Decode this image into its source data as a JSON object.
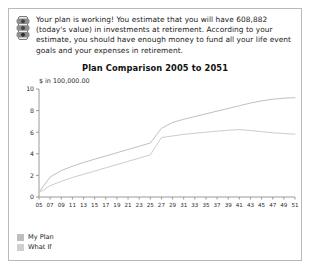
{
  "panel": {
    "status_icon": "traffic-light-icon",
    "message": "Your plan is working! You estimate that you will have 608,882 (today's value) in investments at retirement. According to your estimate, you should have enough money to fund all your life event goals and your expenses in retirement."
  },
  "legend": {
    "items": [
      {
        "label": "My Plan",
        "color": "#bdbdbd"
      },
      {
        "label": "What If",
        "color": "#cfcfcf"
      }
    ]
  },
  "chart_data": {
    "type": "line",
    "title": "Plan Comparison 2005 to 2051",
    "xlabel": "",
    "ylabel": "$ in 100,000.00",
    "unit_label": "$ in 100,000.00",
    "grid": false,
    "legend_position": "bottom-left",
    "xlim": [
      5,
      51
    ],
    "ylim": [
      0,
      10
    ],
    "yticks": [
      0,
      2,
      4,
      6,
      8,
      10
    ],
    "ytick_labels": [
      "0",
      "2",
      "4",
      "6",
      "8",
      "10"
    ],
    "x": [
      5,
      7,
      9,
      11,
      13,
      15,
      17,
      19,
      21,
      23,
      25,
      27,
      29,
      31,
      33,
      35,
      37,
      39,
      41,
      43,
      45,
      47,
      49,
      51
    ],
    "xtick_labels": [
      "05",
      "07",
      "09",
      "11",
      "13",
      "15",
      "17",
      "19",
      "21",
      "23",
      "25",
      "27",
      "29",
      "31",
      "33",
      "35",
      "37",
      "39",
      "41",
      "43",
      "45",
      "47",
      "49",
      "51"
    ],
    "series": [
      {
        "name": "My Plan",
        "color": "#c0c0c0",
        "values": [
          0.45,
          1.85,
          2.45,
          2.85,
          3.2,
          3.5,
          3.8,
          4.1,
          4.4,
          4.7,
          5.0,
          6.35,
          6.9,
          7.2,
          7.45,
          7.7,
          7.95,
          8.2,
          8.45,
          8.7,
          8.9,
          9.05,
          9.15,
          9.2
        ]
      },
      {
        "name": "What If",
        "color": "#cccccc",
        "values": [
          0.4,
          1.05,
          1.45,
          1.8,
          2.1,
          2.4,
          2.7,
          3.0,
          3.3,
          3.6,
          3.9,
          5.5,
          5.65,
          5.8,
          5.9,
          6.0,
          6.1,
          6.18,
          6.25,
          6.15,
          6.05,
          5.95,
          5.88,
          5.82
        ]
      }
    ]
  }
}
